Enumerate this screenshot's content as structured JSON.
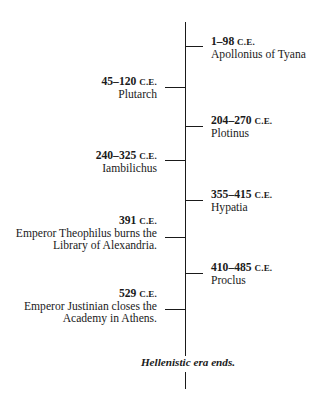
{
  "timeline": {
    "era_suffix": "C.E.",
    "entries": [
      {
        "side": "right",
        "date": "1–98",
        "label_lines": [
          "Apollonius of Tyana"
        ]
      },
      {
        "side": "left",
        "date": "45–120",
        "label_lines": [
          "Plutarch"
        ]
      },
      {
        "side": "right",
        "date": "204–270",
        "label_lines": [
          "Plotinus"
        ]
      },
      {
        "side": "left",
        "date": "240–325",
        "label_lines": [
          "Iambilichus"
        ]
      },
      {
        "side": "right",
        "date": "355–415",
        "label_lines": [
          "Hypatia"
        ]
      },
      {
        "side": "left",
        "date": "391",
        "label_lines": [
          "Emperor Theophilus burns the",
          "Library of Alexandria."
        ]
      },
      {
        "side": "right",
        "date": "410–485",
        "label_lines": [
          "Proclus"
        ]
      },
      {
        "side": "left",
        "date": "529",
        "label_lines": [
          "Emperor Justinian closes the",
          "Academy in Athens."
        ]
      }
    ],
    "end_label": "Hellenistic era ends."
  },
  "colors": {
    "line": "#1a1a1a",
    "text": "#1a1a1a",
    "background": "#ffffff"
  }
}
